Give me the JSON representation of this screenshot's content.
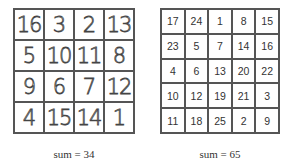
{
  "left_square": {
    "size": 4,
    "cells": [
      16,
      3,
      2,
      13,
      5,
      10,
      11,
      8,
      9,
      6,
      7,
      12,
      4,
      15,
      14,
      1
    ],
    "caption": "sum = 34"
  },
  "right_square": {
    "size": 5,
    "cells": [
      17,
      24,
      1,
      8,
      15,
      23,
      5,
      7,
      14,
      16,
      4,
      6,
      13,
      20,
      22,
      10,
      12,
      19,
      21,
      3,
      11,
      18,
      25,
      2,
      9
    ],
    "caption": "sum = 65"
  }
}
